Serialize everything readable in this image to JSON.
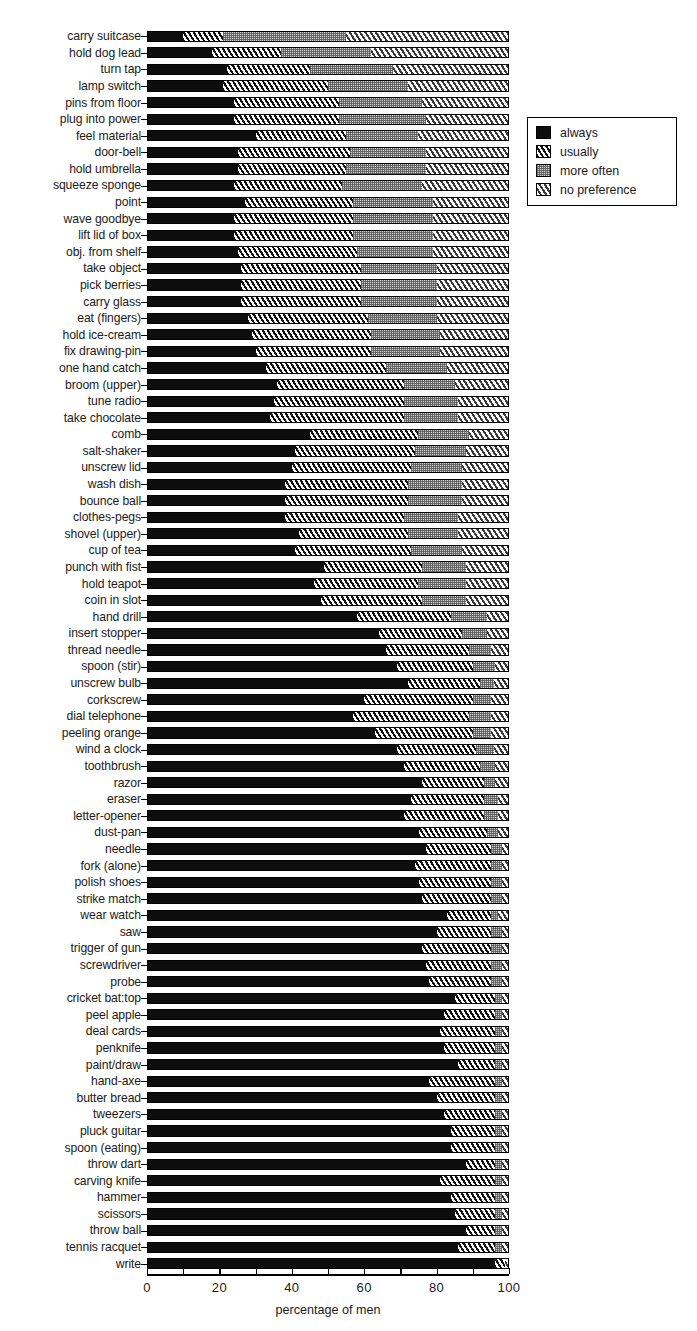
{
  "chart_data": {
    "type": "bar",
    "subtype": "horizontal-stacked-100-percent",
    "title": "",
    "xlabel": "percentage of men",
    "ylabel": "",
    "xlim": [
      0,
      100
    ],
    "xticks": [
      0,
      10,
      20,
      30,
      40,
      50,
      60,
      70,
      80,
      90,
      100
    ],
    "xtick_labels": [
      "0",
      "",
      "20",
      "",
      "40",
      "",
      "60",
      "",
      "80",
      "",
      "100"
    ],
    "grid": false,
    "legend_position": "right-top",
    "series": [
      {
        "name": "always",
        "key": "always",
        "pattern": "solid-black",
        "color": "#0d0d0d"
      },
      {
        "name": "usually",
        "key": "usually",
        "pattern": "black-white-diagonal",
        "color": "#111111"
      },
      {
        "name": "more often",
        "key": "more_often",
        "pattern": "grey-stipple",
        "color": "#cfcfcf"
      },
      {
        "name": "no preference",
        "key": "no_preference",
        "pattern": "white-grey-diagonal",
        "color": "#ffffff"
      }
    ],
    "categories": [
      "carry suitcase",
      "hold dog lead",
      "turn tap",
      "lamp switch",
      "pins from floor",
      "plug into power",
      "feel material",
      "door-bell",
      "hold umbrella",
      "squeeze sponge",
      "point",
      "wave goodbye",
      "lift lid of box",
      "obj. from shelf",
      "take object",
      "pick berries",
      "carry glass",
      "eat (fingers)",
      "hold ice-cream",
      "fix drawing-pin",
      "one hand catch",
      "broom (upper)",
      "tune radio",
      "take chocolate",
      "comb",
      "salt-shaker",
      "unscrew lid",
      "wash dish",
      "bounce ball",
      "clothes-pegs",
      "shovel (upper)",
      "cup of tea",
      "punch with fist",
      "hold teapot",
      "coin in slot",
      "hand drill",
      "insert stopper",
      "thread needle",
      "spoon (stir)",
      "unscrew bulb",
      "corkscrew",
      "dial telephone",
      "peeling orange",
      "wind a clock",
      "toothbrush",
      "razor",
      "eraser",
      "letter-opener",
      "dust-pan",
      "needle",
      "fork (alone)",
      "polish shoes",
      "strike match",
      "wear watch",
      "saw",
      "trigger of gun",
      "screwdriver",
      "probe",
      "cricket bat:top",
      "peel apple",
      "deal cards",
      "penknife",
      "paint/draw",
      "hand-axe",
      "butter bread",
      "tweezers",
      "pluck guitar",
      "spoon (eating)",
      "throw dart",
      "carving knife",
      "hammer",
      "scissors",
      "throw ball",
      "tennis racquet",
      "write"
    ],
    "values": {
      "always": [
        10,
        18,
        22,
        21,
        24,
        24,
        30,
        25,
        25,
        24,
        27,
        24,
        24,
        25,
        26,
        26,
        26,
        28,
        29,
        30,
        33,
        36,
        35,
        34,
        45,
        41,
        40,
        38,
        38,
        38,
        42,
        41,
        49,
        46,
        48,
        58,
        64,
        66,
        69,
        72,
        60,
        57,
        63,
        69,
        71,
        76,
        73,
        71,
        75,
        77,
        74,
        75,
        76,
        83,
        80,
        76,
        77,
        78,
        85,
        82,
        81,
        82,
        86,
        78,
        80,
        82,
        84,
        84,
        88,
        81,
        84,
        85,
        88,
        86,
        96
      ],
      "usually": [
        11,
        19,
        23,
        29,
        29,
        29,
        25,
        31,
        30,
        30,
        30,
        33,
        33,
        33,
        33,
        33,
        33,
        33,
        33,
        32,
        33,
        35,
        36,
        37,
        30,
        33,
        33,
        34,
        34,
        33,
        30,
        32,
        27,
        29,
        28,
        26,
        23,
        23,
        21,
        20,
        30,
        32,
        27,
        22,
        21,
        17,
        20,
        22,
        19,
        18,
        21,
        20,
        19,
        12,
        15,
        19,
        18,
        17,
        11,
        14,
        15,
        14,
        10,
        18,
        16,
        14,
        12,
        12,
        8,
        15,
        12,
        11,
        8,
        10,
        3
      ],
      "more_often": [
        34,
        25,
        23,
        22,
        23,
        24,
        20,
        21,
        22,
        22,
        22,
        22,
        22,
        21,
        21,
        21,
        21,
        19,
        19,
        19,
        17,
        14,
        15,
        15,
        14,
        14,
        14,
        15,
        15,
        15,
        14,
        14,
        12,
        13,
        12,
        10,
        7,
        6,
        6,
        4,
        5,
        6,
        5,
        5,
        4,
        3,
        4,
        4,
        3,
        3,
        3,
        3,
        3,
        2,
        3,
        3,
        3,
        3,
        2,
        2,
        2,
        2,
        2,
        2,
        2,
        2,
        2,
        2,
        2,
        2,
        2,
        2,
        2,
        2,
        0
      ],
      "no_preference": [
        45,
        38,
        32,
        28,
        24,
        23,
        25,
        23,
        23,
        24,
        21,
        21,
        21,
        21,
        20,
        20,
        20,
        20,
        19,
        19,
        17,
        15,
        14,
        14,
        11,
        12,
        13,
        13,
        13,
        14,
        14,
        13,
        12,
        12,
        12,
        6,
        6,
        5,
        4,
        4,
        5,
        5,
        5,
        4,
        4,
        4,
        3,
        3,
        3,
        2,
        2,
        2,
        2,
        3,
        2,
        2,
        2,
        2,
        2,
        2,
        2,
        2,
        2,
        2,
        2,
        2,
        2,
        2,
        2,
        2,
        2,
        2,
        2,
        2,
        1
      ]
    }
  },
  "legend": {
    "items": [
      {
        "label": "always"
      },
      {
        "label": "usually"
      },
      {
        "label": "more often"
      },
      {
        "label": "no preference"
      }
    ]
  },
  "axis": {
    "x_title": "percentage of men"
  }
}
